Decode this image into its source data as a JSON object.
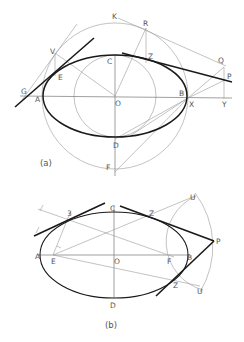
{
  "figure_a": {
    "caption": "(a)",
    "labels": {
      "K": "K",
      "R": "R",
      "V": "V",
      "C": "C",
      "Z": "Z",
      "Q": "Q",
      "P": "P",
      "E": "E",
      "G": "G",
      "A": "A",
      "O": "O",
      "B": "B",
      "X": "X",
      "Y": "Y",
      "D": "D",
      "F": "F"
    }
  },
  "figure_b": {
    "caption": "(b)",
    "labels": {
      "C": "C",
      "three": "3",
      "Z_top": "Z",
      "U_top": "U",
      "P": "P",
      "A": "A",
      "E": "E",
      "O": "O",
      "F": "F",
      "B": "B",
      "Z_bottom": "Z",
      "U_bottom": "U",
      "D": "D"
    }
  },
  "colors": {
    "ellipse": "#1a1a1a",
    "construction": "#9a9a9a",
    "label": "#555555"
  }
}
